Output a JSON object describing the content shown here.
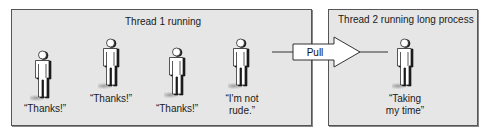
{
  "thread1": {
    "title": "Thread 1 running",
    "people": [
      {
        "caption_lines": [
          "“Thanks!”"
        ]
      },
      {
        "caption_lines": [
          "“Thanks!”"
        ]
      },
      {
        "caption_lines": [
          "“Thanks!”"
        ]
      },
      {
        "caption_lines": [
          "“I'm not",
          "rude.”"
        ]
      }
    ]
  },
  "arrow": {
    "label": "Pull"
  },
  "thread2": {
    "title": "Thread 2 running long process",
    "people": [
      {
        "caption_lines": [
          "“Taking",
          "my time”"
        ]
      }
    ]
  },
  "colors": {
    "panel_fill": "#e6e6e6",
    "border": "#555555",
    "figure_fill": "#ffffff",
    "figure_shadow": "#2a2a2a"
  }
}
